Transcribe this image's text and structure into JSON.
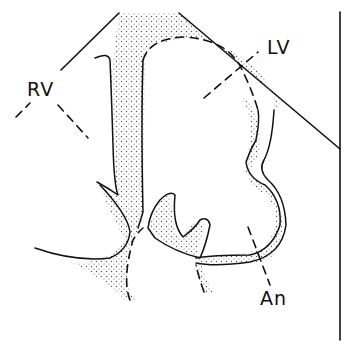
{
  "diagram": {
    "type": "anatomical line drawing (heart cross-section)",
    "labels": {
      "rv": "RV",
      "lv": "LV",
      "an": "An"
    },
    "colors": {
      "ink": "#111111",
      "stipple": "#555555",
      "background": "#ffffff"
    }
  }
}
